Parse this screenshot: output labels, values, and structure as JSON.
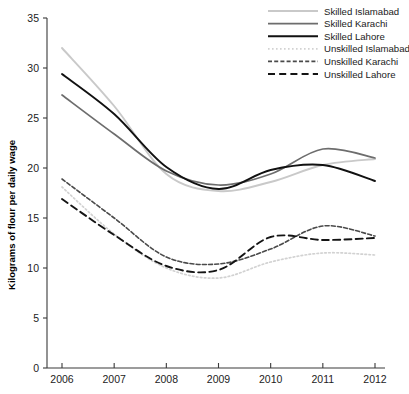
{
  "chart_data": {
    "type": "line",
    "title": "",
    "subtitle": "",
    "xlabel": "",
    "ylabel": "Kilograms of flour per daily wage",
    "x": [
      2006,
      2007,
      2008,
      2009,
      2010,
      2011,
      2012
    ],
    "xtick_labels": [
      "2006",
      "2007",
      "2008",
      "2009",
      "2010",
      "2011",
      "2012"
    ],
    "ytick_labels": [
      "0",
      "5",
      "10",
      "15",
      "20",
      "25",
      "30",
      "35"
    ],
    "ytick_values": [
      0,
      5,
      10,
      15,
      20,
      25,
      30,
      35
    ],
    "xlim": [
      2006,
      2012
    ],
    "ylim": [
      0,
      35
    ],
    "grid": false,
    "legend_position": "top-right",
    "series": [
      {
        "name": "Skilled Islamabad",
        "values": [
          32.0,
          26.2,
          19.4,
          17.7,
          18.6,
          20.3,
          20.9
        ],
        "color": "#c9c9c9",
        "style": "solid",
        "width": 1.9
      },
      {
        "name": "Skilled Karachi",
        "values": [
          27.3,
          23.4,
          19.7,
          18.3,
          19.4,
          21.9,
          21.0
        ],
        "color": "#6d6d6d",
        "style": "solid",
        "width": 1.7
      },
      {
        "name": "Skilled Lahore",
        "values": [
          29.4,
          25.4,
          20.1,
          17.9,
          19.8,
          20.3,
          18.7
        ],
        "color": "#111111",
        "style": "solid",
        "width": 1.9
      },
      {
        "name": "Unskilled Islamabad",
        "values": [
          18.1,
          13.4,
          10.0,
          9.0,
          10.6,
          11.5,
          11.3
        ],
        "color": "#d2d2d2",
        "style": "dotted",
        "width": 1.7
      },
      {
        "name": "Unskilled Karachi",
        "values": [
          18.9,
          15.0,
          11.1,
          10.4,
          11.9,
          14.2,
          13.2
        ],
        "color": "#4a4a4a",
        "style": "dashdot",
        "width": 1.6
      },
      {
        "name": "Unskilled Lahore",
        "values": [
          16.9,
          13.3,
          10.2,
          9.8,
          13.1,
          12.8,
          13.0
        ],
        "color": "#141414",
        "style": "dashed",
        "width": 1.9
      }
    ]
  },
  "legend": {
    "items": [
      {
        "label": "Skilled Islamabad"
      },
      {
        "label": "Skilled Karachi"
      },
      {
        "label": "Skilled Lahore"
      },
      {
        "label": "Unskilled Islamabad"
      },
      {
        "label": "Unskilled Karachi"
      },
      {
        "label": "Unskilled Lahore"
      }
    ]
  }
}
